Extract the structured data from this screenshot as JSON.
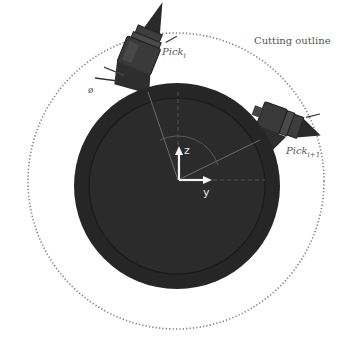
{
  "diagram": {
    "outline_label": "Cutting outline",
    "picks": [
      {
        "base": "Pick",
        "subscript": "i"
      },
      {
        "base": "Pick",
        "subscript": "i+1"
      }
    ],
    "angle_symbol": "ø",
    "axes": {
      "vertical": "z",
      "horizontal": "y"
    },
    "colors": {
      "drum": "#2b2b2b",
      "drum_rim": "#1e1e1e",
      "pick_body": "#3a3a3a",
      "outline": "#777777",
      "axis": "#f2f2f2",
      "guide_lines": "#6a6a6a"
    }
  }
}
